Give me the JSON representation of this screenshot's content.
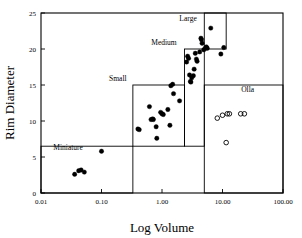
{
  "chart_data": {
    "type": "scatter",
    "title": "",
    "xlabel": "Log Volume",
    "ylabel": "Rim Diameter",
    "xscale": "log",
    "yscale": "linear",
    "xlim": [
      0.01,
      100.0
    ],
    "ylim": [
      0,
      25
    ],
    "grid": false,
    "legend": "none",
    "xticks": [
      0.01,
      0.1,
      1.0,
      10.0,
      100.0
    ],
    "xticklabels": [
      "0.01",
      "0.10",
      "1.00",
      "10.00",
      "100.00"
    ],
    "yticks": [
      0,
      5,
      10,
      15,
      20,
      25
    ],
    "yticklabels": [
      "0",
      "5",
      "10",
      "15",
      "20",
      "25"
    ],
    "series": [
      {
        "name": "jars",
        "marker": "filled-circle",
        "color": "#000000",
        "points": [
          [
            0.036,
            2.6
          ],
          [
            0.042,
            3.1
          ],
          [
            0.046,
            3.2
          ],
          [
            0.052,
            2.9
          ],
          [
            0.1,
            5.8
          ],
          [
            0.4,
            8.9
          ],
          [
            0.42,
            8.8
          ],
          [
            0.62,
            12.0
          ],
          [
            0.66,
            10.2
          ],
          [
            0.7,
            10.3
          ],
          [
            0.72,
            10.2
          ],
          [
            0.8,
            9.2
          ],
          [
            0.82,
            7.6
          ],
          [
            0.95,
            11.2
          ],
          [
            1.0,
            11.0
          ],
          [
            1.05,
            10.9
          ],
          [
            1.25,
            11.6
          ],
          [
            1.35,
            9.4
          ],
          [
            1.4,
            14.9
          ],
          [
            1.5,
            15.1
          ],
          [
            1.55,
            13.8
          ],
          [
            1.95,
            12.8
          ],
          [
            2.55,
            18.2
          ],
          [
            2.65,
            19.0
          ],
          [
            2.75,
            18.7
          ],
          [
            2.85,
            16.4
          ],
          [
            2.95,
            15.5
          ],
          [
            3.0,
            15.4
          ],
          [
            3.1,
            16.0
          ],
          [
            3.3,
            16.3
          ],
          [
            3.4,
            17.2
          ],
          [
            3.55,
            19.4
          ],
          [
            3.7,
            18.6
          ],
          [
            3.8,
            18.3
          ],
          [
            4.2,
            19.6
          ],
          [
            4.4,
            21.5
          ],
          [
            4.5,
            21.3
          ],
          [
            4.6,
            20.8
          ],
          [
            4.9,
            19.9
          ],
          [
            5.2,
            20.1
          ],
          [
            5.4,
            20.3
          ],
          [
            5.6,
            20.1
          ],
          [
            6.4,
            22.9
          ],
          [
            9.4,
            19.3
          ],
          [
            10.5,
            20.2
          ]
        ]
      },
      {
        "name": "ollas",
        "marker": "open-circle",
        "color": "#000000",
        "points": [
          [
            8.2,
            10.4
          ],
          [
            10.0,
            10.8
          ],
          [
            12.0,
            11.0
          ],
          [
            13.0,
            11.0
          ],
          [
            20.0,
            11.0
          ],
          [
            23.0,
            11.0
          ],
          [
            11.5,
            7.0
          ]
        ]
      }
    ],
    "regions": [
      {
        "label": "Miniature",
        "label_x": 0.016,
        "label_y": 6.0,
        "x0": 0.01,
        "x1": 0.33,
        "y0": 0,
        "y1": 6.5,
        "label_anchor": "start"
      },
      {
        "label": "Small",
        "label_x": 0.26,
        "label_y": 15.6,
        "x0": 0.33,
        "x1": 2.35,
        "y0": 6.5,
        "y1": 15.0,
        "label_anchor": "end"
      },
      {
        "label": "Medium",
        "label_x": 1.75,
        "label_y": 20.6,
        "x0": 2.35,
        "x1": 5.0,
        "y0": 6.5,
        "y1": 20.0,
        "label_anchor": "end"
      },
      {
        "label": "Large",
        "label_x": 3.75,
        "label_y": 23.9,
        "x0": 5.0,
        "x1": 11.5,
        "y0": 20.0,
        "y1": 25.0,
        "label_anchor": "end"
      },
      {
        "label": "Olla",
        "label_x": 26.0,
        "label_y": 14.0,
        "x0": 5.0,
        "x1": 100.0,
        "y0": 0,
        "y1": 15.0,
        "label_anchor": "middle"
      }
    ]
  },
  "axes": {
    "x_title": "Log Volume",
    "y_title": "Rim Diameter"
  }
}
